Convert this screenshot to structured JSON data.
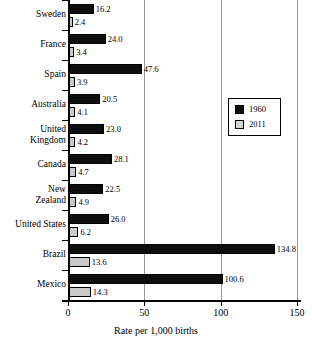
{
  "chart_data": {
    "type": "bar",
    "orientation": "horizontal",
    "title": "",
    "xlabel": "Rate per 1,000 births",
    "ylabel": "",
    "xlim": [
      0,
      150
    ],
    "xticks": [
      0,
      50,
      100,
      150
    ],
    "xtick_labels": [
      "0",
      "50",
      "100",
      "150"
    ],
    "grid": true,
    "legend_position": "center-right",
    "categories": [
      "Sweden",
      "France",
      "Spain",
      "Australia",
      "United\nKingdom",
      "Canada",
      "New\nZealand",
      "United States",
      "Brazil",
      "Mexico"
    ],
    "series": [
      {
        "name": "1960",
        "color": "#0d0d0d",
        "values": [
          16.2,
          24.0,
          47.6,
          20.5,
          23.0,
          28.1,
          22.5,
          26.0,
          134.8,
          100.6
        ],
        "value_labels": [
          "16.2",
          "24.0",
          "47.6",
          "20.5",
          "23.0",
          "28.1",
          "22.5",
          "26.0",
          "134.8",
          "100.6"
        ]
      },
      {
        "name": "2011",
        "color": "#c9c9c9",
        "values": [
          2.4,
          3.4,
          3.9,
          4.1,
          4.2,
          4.7,
          4.9,
          6.2,
          13.6,
          14.3
        ],
        "value_labels": [
          "2.4",
          "3.4",
          "3.9",
          "4.1",
          "4.2",
          "4.7",
          "4.9",
          "6.2",
          "13.6",
          "14.3"
        ]
      }
    ]
  },
  "legend": {
    "entries": [
      {
        "label": "1960",
        "swatch": "black-square-icon"
      },
      {
        "label": "2011",
        "swatch": "gray-square-icon"
      }
    ]
  }
}
